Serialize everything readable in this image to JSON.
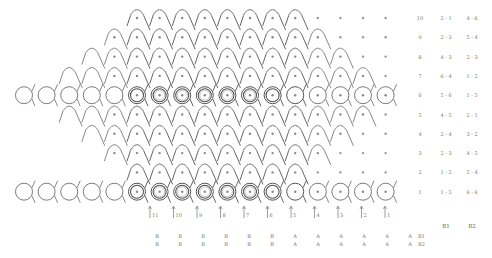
{
  "diagram": {
    "type": "knit-stitch-chart",
    "line_color": "#7a7a7a",
    "dark_line_color": "#555555",
    "light_line_color": "#b5b5b5",
    "background": "#ffffff"
  },
  "rows": [
    {
      "number": "10",
      "b1": "2 - 1",
      "b2": "4 - 6"
    },
    {
      "number": "9",
      "b1": "2 - 3",
      "b2": "5 - 4"
    },
    {
      "number": "8",
      "b1": "4 - 3",
      "b2": "2 - 3"
    },
    {
      "number": "7",
      "b1": "6 - 4",
      "b2": "1 - 2"
    },
    {
      "number": "6",
      "b1": "5 - 6",
      "b2": "1 - 5"
    },
    {
      "number": "5",
      "b1": "4 - 5",
      "b2": "2 - 1"
    },
    {
      "number": "4",
      "b1": "2 - 4",
      "b2": "3 - 2"
    },
    {
      "number": "3",
      "b1": "2 - 3",
      "b2": "4 - 5"
    },
    {
      "number": "2",
      "b1": "1 - 2",
      "b2": "5 - 4"
    },
    {
      "number": "1",
      "b1": "1 - 5",
      "b2": "6 - 6"
    }
  ],
  "pair_headers": {
    "b1": "B1",
    "b2": "B2"
  },
  "needle_labels": [
    "11",
    "10",
    "9",
    "8",
    "7",
    "6",
    "5",
    "4",
    "3",
    "2",
    "1"
  ],
  "bar_rows": [
    {
      "label": "B1",
      "values": [
        "B",
        "B",
        "B",
        "B",
        "B",
        "B",
        "A",
        "A",
        "A",
        "A",
        "A",
        "A"
      ]
    },
    {
      "label": "B2",
      "values": [
        "B",
        "B",
        "B",
        "B",
        "B",
        "B",
        "A",
        "A",
        "A",
        "A",
        "A",
        "A"
      ]
    }
  ]
}
